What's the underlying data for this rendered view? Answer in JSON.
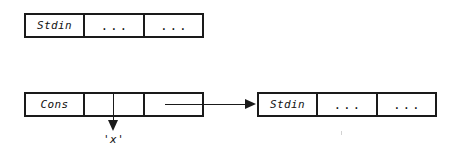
{
  "diagram": {
    "ink_color": "#1a1a1a",
    "background_color": "#ffffff",
    "top_node": {
      "cells": [
        {
          "label": "Stdin",
          "kind": "tag"
        },
        {
          "label": "...",
          "kind": "dots"
        },
        {
          "label": "...",
          "kind": "dots"
        }
      ]
    },
    "cons_node": {
      "cells": [
        {
          "label": "Cons",
          "kind": "tag"
        },
        {
          "label": "",
          "kind": "slot-head"
        },
        {
          "label": "",
          "kind": "slot-tail"
        }
      ]
    },
    "right_node": {
      "cells": [
        {
          "label": "Stdin",
          "kind": "tag"
        },
        {
          "label": "...",
          "kind": "dots"
        },
        {
          "label": "...",
          "kind": "dots"
        }
      ]
    },
    "head_value_label": "'x'",
    "tail_arrow": {
      "from": "cons-tail-slot",
      "to": "right-stdin-node"
    },
    "head_arrow": {
      "from": "cons-head-slot",
      "to": "head-value-label"
    }
  }
}
